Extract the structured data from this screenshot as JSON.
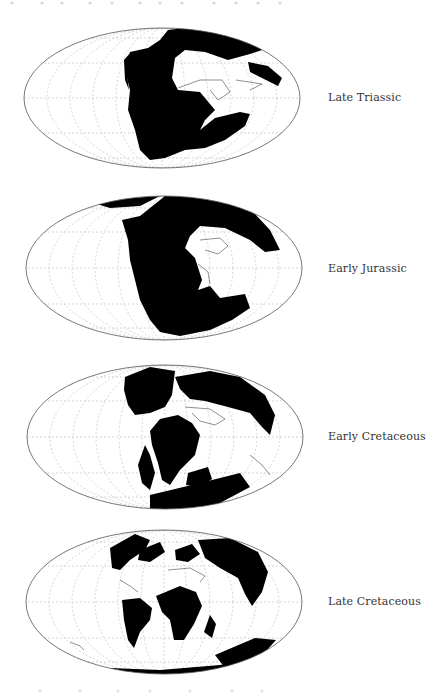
{
  "figure": {
    "projection": "mollweide",
    "style": {
      "land_color": "#000000",
      "ocean_color": "#ffffff",
      "outline_color": "#555555",
      "graticule_color": "#bbbbbb",
      "label_color": "#333333"
    },
    "panels": [
      {
        "label": "Late Triassic"
      },
      {
        "label": "Early Jurassic"
      },
      {
        "label": "Early Cretaceous"
      },
      {
        "label": "Late Cretaceous"
      }
    ]
  }
}
